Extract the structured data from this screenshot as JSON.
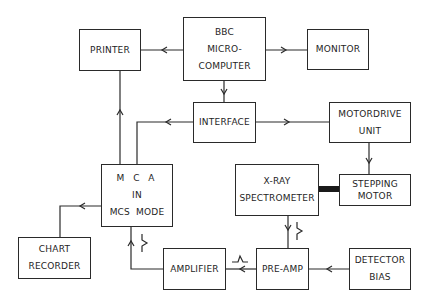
{
  "diagram": {
    "type": "block-diagram",
    "line_color": "#2a2a2a",
    "blocks": {
      "printer": {
        "lines": [
          "PRINTER"
        ]
      },
      "bbc": {
        "lines": [
          "BBC",
          "MICRO-",
          "COMPUTER"
        ]
      },
      "monitor": {
        "lines": [
          "MONITOR"
        ]
      },
      "interface": {
        "lines": [
          "INTERFACE"
        ]
      },
      "motordrive": {
        "lines": [
          "MOTORDRIVE",
          "UNIT"
        ]
      },
      "mca": {
        "lines": [
          "M C A",
          "IN",
          "MCS  MODE"
        ]
      },
      "spectrometer": {
        "lines": [
          "X-RAY",
          "SPECTROMETER"
        ]
      },
      "stepping": {
        "lines": [
          "STEPPING",
          "MOTOR"
        ]
      },
      "chart": {
        "lines": [
          "CHART",
          "RECORDER"
        ]
      },
      "amplifier": {
        "lines": [
          "AMPLIFIER"
        ]
      },
      "preamp": {
        "lines": [
          "PRE-AMP"
        ]
      },
      "bias": {
        "lines": [
          "DETECTOR",
          "BIAS"
        ]
      }
    },
    "connections": [
      {
        "from": "BBC MICRO-COMPUTER",
        "to": "PRINTER"
      },
      {
        "from": "BBC MICRO-COMPUTER",
        "to": "MONITOR"
      },
      {
        "from": "BBC MICRO-COMPUTER",
        "to": "INTERFACE"
      },
      {
        "from": "INTERFACE",
        "to": "MOTORDRIVE UNIT"
      },
      {
        "from": "INTERFACE",
        "to": "MCA IN MCS MODE"
      },
      {
        "from": "MCA IN MCS MODE",
        "to": "PRINTER"
      },
      {
        "from": "MOTORDRIVE UNIT",
        "to": "STEPPING MOTOR"
      },
      {
        "from": "STEPPING MOTOR",
        "to": "X-RAY SPECTROMETER",
        "style": "mechanical-shaft"
      },
      {
        "from": "X-RAY SPECTROMETER",
        "to": "PRE-AMP",
        "signal": "step-pulse"
      },
      {
        "from": "DETECTOR BIAS",
        "to": "PRE-AMP"
      },
      {
        "from": "PRE-AMP",
        "to": "AMPLIFIER",
        "signal": "pulse"
      },
      {
        "from": "AMPLIFIER",
        "to": "MCA IN MCS MODE",
        "signal": "step-pulse"
      },
      {
        "from": "MCA IN MCS MODE",
        "to": "CHART RECORDER"
      }
    ]
  }
}
